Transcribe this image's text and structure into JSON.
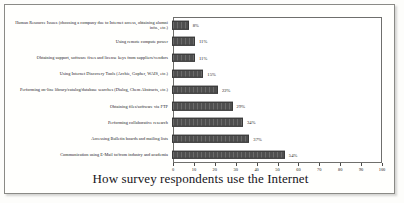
{
  "chart_data": {
    "type": "bar",
    "orientation": "horizontal",
    "title": "How survey respondents use the Internet",
    "xlabel": "",
    "ylabel": "",
    "xlim": [
      0,
      100
    ],
    "xticks": [
      0,
      10,
      20,
      30,
      40,
      50,
      60,
      70,
      80,
      90,
      100
    ],
    "grid": false,
    "legend": false,
    "value_suffix": "%",
    "bar_color": "#4f4f4f",
    "categories": [
      "Human Resource Issues (choosing a company due to Internet access, obtaining alumni info., etc.)",
      "Using remote compute power",
      "Obtaining support, software fixes and license keys from suppliers/vendors",
      "Using Internet Discovery Tools (Archie, Gopher, WAIS, etc.)",
      "Performing on-line library/catalog/database searches (Dialog, Chem Abstracts, etc.)",
      "Obtaining files/software via FTP",
      "Performing collaborative research",
      "Accessing Bulletin boards and mailing lists",
      "Communication using E-Mail to/from industry and academia"
    ],
    "values": [
      8,
      11,
      11,
      15,
      22,
      29,
      34,
      37,
      54
    ],
    "value_labels": [
      "8%",
      "11%",
      "11%",
      "15%",
      "22%",
      "29%",
      "34%",
      "37%",
      "54%"
    ],
    "tick_labels": [
      "0",
      "10",
      "20",
      "30",
      "40",
      "50",
      "60",
      "70",
      "80",
      "90",
      "100"
    ]
  }
}
